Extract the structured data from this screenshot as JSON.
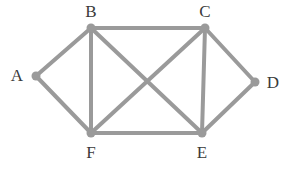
{
  "figure": {
    "kind": "undirected-graph-diagram",
    "width": 285,
    "height": 187,
    "background_color": "#ffffff"
  },
  "style": {
    "edge_color": "#9a9a9a",
    "edge_width": 4,
    "vertex_color": "#9a9a9a",
    "vertex_radius": 4.5,
    "label_color": "#3a3a3a",
    "label_font_size": 17
  },
  "graph": {
    "vertex_count": 6,
    "edge_count": 10,
    "vertices": [
      {
        "id": "A",
        "label": "A",
        "x": 36,
        "y": 76,
        "label_x": 17,
        "label_y": 75,
        "degree": 2
      },
      {
        "id": "B",
        "label": "B",
        "x": 91,
        "y": 28,
        "label_x": 91,
        "label_y": 11,
        "degree": 4
      },
      {
        "id": "C",
        "label": "C",
        "x": 205,
        "y": 28,
        "label_x": 205,
        "label_y": 11,
        "degree": 4
      },
      {
        "id": "D",
        "label": "D",
        "x": 255,
        "y": 82,
        "label_x": 273,
        "label_y": 82,
        "degree": 2
      },
      {
        "id": "E",
        "label": "E",
        "x": 202,
        "y": 133,
        "label_x": 202,
        "label_y": 152,
        "degree": 4
      },
      {
        "id": "F",
        "label": "F",
        "x": 91,
        "y": 133,
        "label_x": 91,
        "label_y": 152,
        "degree": 4
      }
    ],
    "edges": [
      {
        "id": "A-B",
        "from": "A",
        "to": "B"
      },
      {
        "id": "A-F",
        "from": "A",
        "to": "F"
      },
      {
        "id": "B-C",
        "from": "B",
        "to": "C"
      },
      {
        "id": "B-F",
        "from": "B",
        "to": "F"
      },
      {
        "id": "B-E",
        "from": "B",
        "to": "E"
      },
      {
        "id": "C-F",
        "from": "C",
        "to": "F"
      },
      {
        "id": "C-E",
        "from": "C",
        "to": "E"
      },
      {
        "id": "C-D",
        "from": "C",
        "to": "D"
      },
      {
        "id": "D-E",
        "from": "D",
        "to": "E"
      },
      {
        "id": "E-F",
        "from": "E",
        "to": "F"
      }
    ]
  }
}
